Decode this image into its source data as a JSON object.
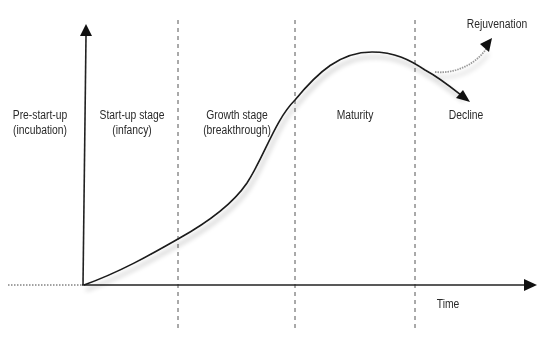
{
  "diagram": {
    "title": "",
    "x_axis_label": "Time",
    "stages": [
      {
        "line1": "Pre-start-up",
        "line2": "(incubation)"
      },
      {
        "line1": "Start-up stage",
        "line2": "(infancy)"
      },
      {
        "line1": "Growth stage",
        "line2": "(breakthrough)"
      },
      {
        "line1": "Maturity",
        "line2": ""
      },
      {
        "line1": "Decline",
        "line2": ""
      }
    ],
    "branch_labels": {
      "rejuvenation": "Rejuvenation",
      "decline": "Decline"
    },
    "colors": {
      "curve": "#1a1a1a",
      "axis": "#1a1a1a",
      "divider": "#555555",
      "rejuvenation": "#9a9a9a",
      "shadow": "#bbbbbb"
    }
  }
}
